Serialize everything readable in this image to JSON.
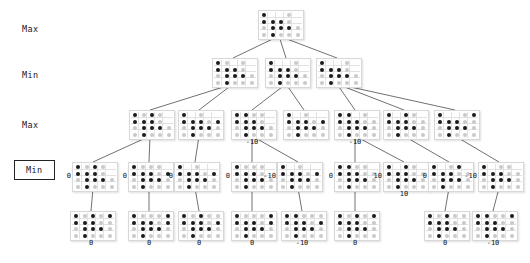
{
  "figure": {
    "kind": "minimax-game-tree",
    "board": {
      "cols": 5,
      "rows": 4,
      "dark_color": "#1b1b1b",
      "light_color": "#c9c9c9"
    }
  },
  "levels": [
    {
      "id": "level-max-1",
      "label": "Max",
      "boxed": false,
      "x": 22,
      "y": 24
    },
    {
      "id": "level-min-1",
      "label": "Min",
      "boxed": false,
      "x": 22,
      "y": 70
    },
    {
      "id": "level-max-2",
      "label": "Max",
      "boxed": false,
      "x": 22,
      "y": 120
    },
    {
      "id": "level-min-2",
      "label": "Min",
      "boxed": true,
      "x": 22,
      "y": 166
    }
  ],
  "nodes": [
    {
      "id": "n-root",
      "level": 0,
      "x": 258,
      "y": 10,
      "w": 42,
      "h": 26,
      "cells": [
        [
          "d",
          "e",
          "e",
          "l",
          "e"
        ],
        [
          "d",
          "d",
          "d",
          "l",
          "e"
        ],
        [
          "l",
          "d",
          "d",
          "d",
          "l"
        ],
        [
          "l",
          "d",
          "l",
          "l",
          "l"
        ]
      ]
    },
    {
      "id": "n-min-1",
      "level": 1,
      "x": 212,
      "y": 58,
      "w": 42,
      "h": 26,
      "cells": [
        [
          "d",
          "l",
          "e",
          "l",
          "e"
        ],
        [
          "d",
          "d",
          "d",
          "l",
          "e"
        ],
        [
          "l",
          "d",
          "d",
          "d",
          "l"
        ],
        [
          "l",
          "d",
          "l",
          "l",
          "l"
        ]
      ]
    },
    {
      "id": "n-min-2",
      "level": 1,
      "x": 265,
      "y": 58,
      "w": 42,
      "h": 26,
      "cells": [
        [
          "d",
          "e",
          "e",
          "l",
          "e"
        ],
        [
          "d",
          "d",
          "d",
          "l",
          "e"
        ],
        [
          "l",
          "d",
          "d",
          "d",
          "l"
        ],
        [
          "l",
          "d",
          "l",
          "l",
          "l"
        ]
      ]
    },
    {
      "id": "n-min-3",
      "level": 1,
      "x": 316,
      "y": 58,
      "w": 42,
      "h": 26,
      "cells": [
        [
          "d",
          "e",
          "e",
          "l",
          "e"
        ],
        [
          "d",
          "d",
          "d",
          "l",
          "e"
        ],
        [
          "l",
          "d",
          "d",
          "d",
          "l"
        ],
        [
          "l",
          "d",
          "l",
          "l",
          "l"
        ]
      ]
    },
    {
      "id": "n-max-1",
      "level": 2,
      "x": 129,
      "y": 110,
      "w": 42,
      "h": 26,
      "cells": [
        [
          "d",
          "l",
          "d",
          "l",
          "e"
        ],
        [
          "d",
          "d",
          "d",
          "l",
          "e"
        ],
        [
          "l",
          "d",
          "d",
          "d",
          "l"
        ],
        [
          "l",
          "d",
          "l",
          "l",
          "l"
        ]
      ]
    },
    {
      "id": "n-max-2",
      "level": 2,
      "x": 178,
      "y": 110,
      "w": 42,
      "h": 26,
      "cells": [
        [
          "d",
          "e",
          "l",
          "e",
          "e"
        ],
        [
          "d",
          "d",
          "d",
          "l",
          "d"
        ],
        [
          "l",
          "d",
          "d",
          "d",
          "l"
        ],
        [
          "l",
          "d",
          "l",
          "l",
          "l"
        ]
      ]
    },
    {
      "id": "n-max-3",
      "level": 2,
      "x": 231,
      "y": 110,
      "w": 42,
      "h": 26,
      "value": "-10",
      "value_pos": "below",
      "cells": [
        [
          "d",
          "d",
          "l",
          "l",
          "e"
        ],
        [
          "d",
          "d",
          "d",
          "l",
          "e"
        ],
        [
          "l",
          "d",
          "d",
          "d",
          "l"
        ],
        [
          "l",
          "d",
          "l",
          "l",
          "l"
        ]
      ]
    },
    {
      "id": "n-max-4",
      "level": 2,
      "x": 283,
      "y": 110,
      "w": 42,
      "h": 26,
      "cells": [
        [
          "d",
          "e",
          "l",
          "e",
          "e"
        ],
        [
          "d",
          "d",
          "d",
          "l",
          "d"
        ],
        [
          "l",
          "d",
          "d",
          "d",
          "l"
        ],
        [
          "l",
          "d",
          "l",
          "l",
          "l"
        ]
      ]
    },
    {
      "id": "n-max-5",
      "level": 2,
      "x": 334,
      "y": 110,
      "w": 42,
      "h": 26,
      "value": "-10",
      "value_pos": "below",
      "cells": [
        [
          "d",
          "d",
          "e",
          "l",
          "e"
        ],
        [
          "d",
          "d",
          "d",
          "l",
          "l"
        ],
        [
          "l",
          "d",
          "d",
          "d",
          "l"
        ],
        [
          "l",
          "d",
          "l",
          "l",
          "l"
        ]
      ]
    },
    {
      "id": "n-max-6",
      "level": 2,
      "x": 383,
      "y": 110,
      "w": 42,
      "h": 26,
      "cells": [
        [
          "d",
          "e",
          "d",
          "l",
          "e"
        ],
        [
          "d",
          "d",
          "d",
          "l",
          "l"
        ],
        [
          "l",
          "d",
          "d",
          "d",
          "l"
        ],
        [
          "l",
          "d",
          "l",
          "l",
          "l"
        ]
      ]
    },
    {
      "id": "n-max-7",
      "level": 2,
      "x": 434,
      "y": 110,
      "w": 42,
      "h": 26,
      "cells": [
        [
          "d",
          "e",
          "e",
          "l",
          "d"
        ],
        [
          "d",
          "d",
          "d",
          "l",
          "l"
        ],
        [
          "l",
          "d",
          "d",
          "d",
          "l"
        ],
        [
          "l",
          "d",
          "l",
          "l",
          "l"
        ]
      ]
    },
    {
      "id": "n-min2-1",
      "level": 3,
      "x": 72,
      "y": 162,
      "w": 42,
      "h": 26,
      "value": "0",
      "value_pos": "left",
      "cells": [
        [
          "d",
          "l",
          "d",
          "l",
          "e"
        ],
        [
          "d",
          "d",
          "d",
          "l",
          "e"
        ],
        [
          "l",
          "d",
          "d",
          "d",
          "l"
        ],
        [
          "l",
          "d",
          "l",
          "l",
          "l"
        ]
      ]
    },
    {
      "id": "n-min2-2",
      "level": 3,
      "x": 128,
      "y": 162,
      "w": 42,
      "h": 26,
      "value": "0",
      "value_pos": "left",
      "cells": [
        [
          "d",
          "l",
          "l",
          "l",
          "e"
        ],
        [
          "d",
          "d",
          "d",
          "l",
          "d"
        ],
        [
          "l",
          "d",
          "d",
          "d",
          "l"
        ],
        [
          "l",
          "d",
          "l",
          "l",
          "l"
        ]
      ]
    },
    {
      "id": "n-min2-3",
      "level": 3,
      "x": 174,
      "y": 162,
      "w": 42,
      "h": 26,
      "value": "0",
      "value_pos": "left",
      "cells": [
        [
          "d",
          "e",
          "l",
          "e",
          "e"
        ],
        [
          "d",
          "d",
          "d",
          "l",
          "d"
        ],
        [
          "l",
          "d",
          "d",
          "d",
          "l"
        ],
        [
          "l",
          "d",
          "l",
          "l",
          "l"
        ]
      ]
    },
    {
      "id": "n-min2-4",
      "level": 3,
      "x": 231,
      "y": 162,
      "w": 42,
      "h": 26,
      "value": "0",
      "value_pos": "left",
      "cells": [
        [
          "d",
          "l",
          "l",
          "l",
          "e"
        ],
        [
          "d",
          "d",
          "d",
          "l",
          "e"
        ],
        [
          "l",
          "d",
          "d",
          "d",
          "l"
        ],
        [
          "l",
          "d",
          "l",
          "l",
          "l"
        ]
      ]
    },
    {
      "id": "n-min2-5",
      "level": 3,
      "x": 277,
      "y": 162,
      "w": 42,
      "h": 26,
      "value": "-10",
      "value_pos": "left",
      "cells": [
        [
          "d",
          "e",
          "l",
          "e",
          "e"
        ],
        [
          "d",
          "d",
          "d",
          "l",
          "d"
        ],
        [
          "l",
          "d",
          "d",
          "d",
          "l"
        ],
        [
          "l",
          "d",
          "l",
          "l",
          "l"
        ]
      ]
    },
    {
      "id": "n-min2-6",
      "level": 3,
      "x": 334,
      "y": 162,
      "w": 42,
      "h": 26,
      "value": "0",
      "value_pos": "left",
      "cells": [
        [
          "d",
          "d",
          "l",
          "l",
          "e"
        ],
        [
          "d",
          "d",
          "d",
          "l",
          "l"
        ],
        [
          "l",
          "d",
          "d",
          "d",
          "l"
        ],
        [
          "l",
          "d",
          "l",
          "l",
          "l"
        ]
      ]
    },
    {
      "id": "n-min2-7",
      "level": 3,
      "x": 383,
      "y": 162,
      "w": 42,
      "h": 26,
      "value": "10",
      "value_pos": "left",
      "value_below": "10",
      "cells": [
        [
          "d",
          "e",
          "d",
          "l",
          "e"
        ],
        [
          "d",
          "d",
          "d",
          "l",
          "l"
        ],
        [
          "l",
          "d",
          "d",
          "d",
          "l"
        ],
        [
          "l",
          "d",
          "l",
          "l",
          "l"
        ]
      ]
    },
    {
      "id": "n-min2-8",
      "level": 3,
      "x": 428,
      "y": 162,
      "w": 42,
      "h": 26,
      "value": "0",
      "value_pos": "left",
      "cells": [
        [
          "d",
          "e",
          "l",
          "d",
          "e"
        ],
        [
          "d",
          "d",
          "d",
          "l",
          "l"
        ],
        [
          "l",
          "d",
          "d",
          "d",
          "l"
        ],
        [
          "l",
          "d",
          "l",
          "l",
          "l"
        ]
      ]
    },
    {
      "id": "n-min2-9",
      "level": 3,
      "x": 478,
      "y": 162,
      "w": 42,
      "h": 26,
      "value": "-10",
      "value_pos": "left",
      "cells": [
        [
          "d",
          "e",
          "l",
          "l",
          "e"
        ],
        [
          "d",
          "d",
          "d",
          "l",
          "l"
        ],
        [
          "l",
          "d",
          "d",
          "d",
          "l"
        ],
        [
          "l",
          "d",
          "l",
          "l",
          "l"
        ]
      ]
    },
    {
      "id": "n-leaf-1",
      "level": 4,
      "x": 70,
      "y": 211,
      "w": 42,
      "h": 26,
      "value": "0",
      "value_pos": "below",
      "cells": [
        [
          "d",
          "l",
          "d",
          "l",
          "d"
        ],
        [
          "d",
          "d",
          "d",
          "l",
          "l"
        ],
        [
          "l",
          "d",
          "d",
          "d",
          "l"
        ],
        [
          "l",
          "d",
          "l",
          "l",
          "l"
        ]
      ]
    },
    {
      "id": "n-leaf-2",
      "level": 4,
      "x": 128,
      "y": 211,
      "w": 42,
      "h": 26,
      "value": "0",
      "value_pos": "below",
      "cells": [
        [
          "d",
          "l",
          "l",
          "l",
          "d"
        ],
        [
          "d",
          "d",
          "d",
          "l",
          "d"
        ],
        [
          "l",
          "d",
          "d",
          "d",
          "l"
        ],
        [
          "l",
          "d",
          "l",
          "l",
          "l"
        ]
      ]
    },
    {
      "id": "n-leaf-3",
      "level": 4,
      "x": 178,
      "y": 211,
      "w": 42,
      "h": 26,
      "value": "0",
      "value_pos": "below",
      "cells": [
        [
          "d",
          "l",
          "d",
          "l",
          "l"
        ],
        [
          "d",
          "d",
          "d",
          "l",
          "d"
        ],
        [
          "l",
          "d",
          "d",
          "d",
          "l"
        ],
        [
          "l",
          "d",
          "l",
          "l",
          "l"
        ]
      ]
    },
    {
      "id": "n-leaf-4",
      "level": 4,
      "x": 231,
      "y": 211,
      "w": 42,
      "h": 26,
      "value": "0",
      "value_pos": "below",
      "cells": [
        [
          "d",
          "l",
          "l",
          "l",
          "d"
        ],
        [
          "d",
          "d",
          "d",
          "l",
          "d"
        ],
        [
          "l",
          "d",
          "d",
          "d",
          "l"
        ],
        [
          "l",
          "d",
          "l",
          "l",
          "l"
        ]
      ]
    },
    {
      "id": "n-leaf-5",
      "level": 4,
      "x": 281,
      "y": 211,
      "w": 42,
      "h": 26,
      "value": "-10",
      "value_pos": "below",
      "cells": [
        [
          "d",
          "d",
          "l",
          "l",
          "l"
        ],
        [
          "d",
          "d",
          "d",
          "l",
          "d"
        ],
        [
          "l",
          "d",
          "d",
          "d",
          "l"
        ],
        [
          "l",
          "d",
          "l",
          "l",
          "l"
        ]
      ]
    },
    {
      "id": "n-leaf-6",
      "level": 4,
      "x": 334,
      "y": 211,
      "w": 42,
      "h": 26,
      "value": "0",
      "value_pos": "below",
      "cells": [
        [
          "d",
          "l",
          "d",
          "l",
          "d"
        ],
        [
          "d",
          "d",
          "d",
          "l",
          "l"
        ],
        [
          "l",
          "d",
          "d",
          "d",
          "l"
        ],
        [
          "l",
          "d",
          "l",
          "l",
          "l"
        ]
      ]
    },
    {
      "id": "n-leaf-7",
      "level": 4,
      "x": 424,
      "y": 211,
      "w": 42,
      "h": 26,
      "value": "0",
      "value_pos": "below",
      "cells": [
        [
          "d",
          "l",
          "d",
          "l",
          "l"
        ],
        [
          "d",
          "d",
          "d",
          "l",
          "l"
        ],
        [
          "l",
          "d",
          "d",
          "d",
          "l"
        ],
        [
          "l",
          "d",
          "l",
          "l",
          "l"
        ]
      ]
    },
    {
      "id": "n-leaf-8",
      "level": 4,
      "x": 472,
      "y": 211,
      "w": 42,
      "h": 26,
      "value": "-10",
      "value_pos": "below",
      "cells": [
        [
          "d",
          "d",
          "l",
          "l",
          "d"
        ],
        [
          "d",
          "d",
          "d",
          "l",
          "l"
        ],
        [
          "l",
          "d",
          "d",
          "d",
          "l"
        ],
        [
          "l",
          "d",
          "l",
          "l",
          "l"
        ]
      ]
    }
  ],
  "edges": [
    [
      "n-root",
      "n-min-1"
    ],
    [
      "n-root",
      "n-min-2"
    ],
    [
      "n-root",
      "n-min-3"
    ],
    [
      "n-min-1",
      "n-max-1"
    ],
    [
      "n-min-1",
      "n-max-2"
    ],
    [
      "n-min-2",
      "n-max-3"
    ],
    [
      "n-min-2",
      "n-max-4"
    ],
    [
      "n-min-3",
      "n-max-5"
    ],
    [
      "n-min-3",
      "n-max-6"
    ],
    [
      "n-min-3",
      "n-max-7"
    ],
    [
      "n-max-1",
      "n-min2-1"
    ],
    [
      "n-max-1",
      "n-min2-2"
    ],
    [
      "n-max-2",
      "n-min2-3"
    ],
    [
      "n-max-3",
      "n-min2-4"
    ],
    [
      "n-max-3",
      "n-min2-5"
    ],
    [
      "n-max-5",
      "n-min2-6"
    ],
    [
      "n-max-5",
      "n-min2-7"
    ],
    [
      "n-max-6",
      "n-min2-8"
    ],
    [
      "n-max-7",
      "n-min2-9"
    ],
    [
      "n-min2-1",
      "n-leaf-1"
    ],
    [
      "n-min2-2",
      "n-leaf-2"
    ],
    [
      "n-min2-3",
      "n-leaf-3"
    ],
    [
      "n-min2-4",
      "n-leaf-4"
    ],
    [
      "n-min2-5",
      "n-leaf-5"
    ],
    [
      "n-min2-6",
      "n-leaf-6"
    ],
    [
      "n-min2-8",
      "n-leaf-7"
    ],
    [
      "n-min2-9",
      "n-leaf-8"
    ]
  ]
}
